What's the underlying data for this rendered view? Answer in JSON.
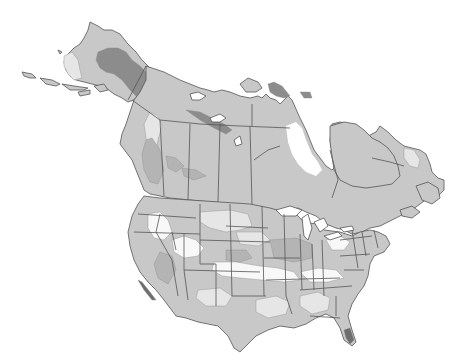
{
  "map": {
    "subject": "North America shaded zone map",
    "regions": [
      "Alaska",
      "Canada",
      "United States"
    ],
    "colors": {
      "background": "#ffffff",
      "land_base": "#c8c8c8",
      "zone_light": "#e6e6e6",
      "zone_white": "#f8f8f8",
      "zone_mid": "#b4b4b4",
      "zone_dark": "#8c8c8c",
      "zone_darkest": "#6e6e6e",
      "border": "#555555"
    },
    "text_labels": []
  }
}
